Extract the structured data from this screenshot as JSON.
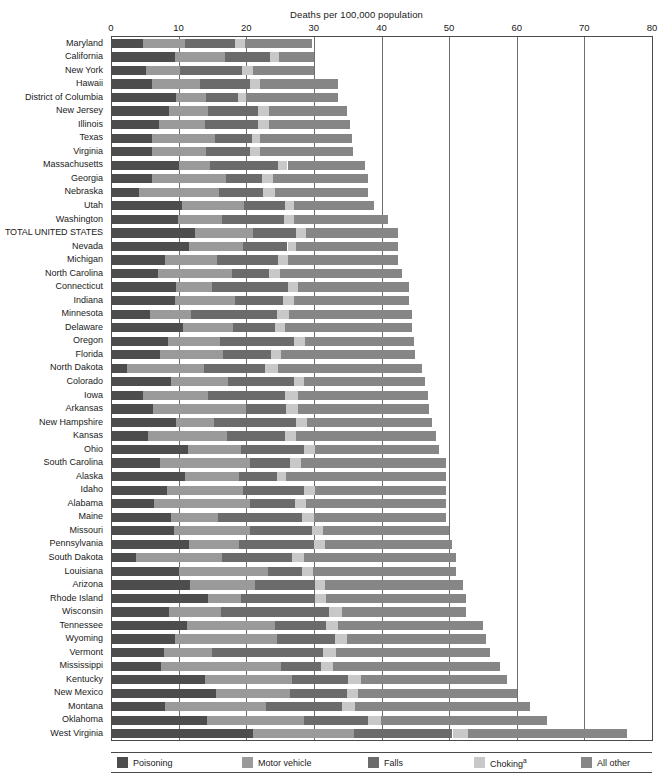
{
  "axis": {
    "title": "Deaths per 100,000 population",
    "ticks": [
      0,
      10,
      20,
      30,
      40,
      50,
      60,
      70,
      80
    ],
    "tick_labels": [
      "0",
      "10",
      "20",
      "30",
      "40",
      "50",
      "60",
      "70",
      "80"
    ],
    "min": 0,
    "max": 80
  },
  "legend": {
    "items": [
      {
        "label": "Poisoning",
        "color": "#4d4d4d",
        "superscript": ""
      },
      {
        "label": "Motor vehicle",
        "color": "#9a9a9a",
        "superscript": ""
      },
      {
        "label": "Falls",
        "color": "#6b6b6b",
        "superscript": ""
      },
      {
        "label": "Choking",
        "color": "#c8c8c8",
        "superscript": "a"
      },
      {
        "label": "All other",
        "color": "#868686",
        "superscript": ""
      }
    ]
  },
  "chart_data": {
    "type": "bar",
    "orientation": "horizontal",
    "stacked": true,
    "title": "Deaths per 100,000 population",
    "xlabel": "Deaths per 100,000 population",
    "ylabel": "",
    "xlim": [
      0,
      80
    ],
    "grid": true,
    "legend_position": "bottom",
    "series": [
      {
        "name": "Poisoning",
        "color": "#4d4d4d"
      },
      {
        "name": "Motor vehicle",
        "color": "#9a9a9a"
      },
      {
        "name": "Falls",
        "color": "#6b6b6b"
      },
      {
        "name": "Choking",
        "color": "#c8c8c8"
      },
      {
        "name": "All other",
        "color": "#868686"
      }
    ],
    "categories": [
      "Maryland",
      "California",
      "New York",
      "Hawaii",
      "District of Columbia",
      "New Jersey",
      "Illinois",
      "Texas",
      "Virginia",
      "Massachusetts",
      "Georgia",
      "Nebraska",
      "Utah",
      "Washington",
      "TOTAL UNITED STATES",
      "Nevada",
      "Michigan",
      "North Carolina",
      "Connecticut",
      "Indiana",
      "Minnesota",
      "Delaware",
      "Oregon",
      "Florida",
      "North Dakota",
      "Colorado",
      "Iowa",
      "Arkansas",
      "New Hampshire",
      "Kansas",
      "Ohio",
      "South Carolina",
      "Alaska",
      "Idaho",
      "Alabama",
      "Maine",
      "Missouri",
      "Pennsylvania",
      "South Dakota",
      "Louisiana",
      "Arizona",
      "Rhode Island",
      "Wisconsin",
      "Tennessee",
      "Wyoming",
      "Vermont",
      "Mississippi",
      "Kentucky",
      "New Mexico",
      "Montana",
      "Oklahoma",
      "West Virginia"
    ],
    "rows": [
      {
        "state": "Maryland",
        "values": [
          4.8,
          6.2,
          7.3,
          1.5,
          9.9
        ],
        "total": 29.7
      },
      {
        "state": "California",
        "values": [
          9.5,
          7.4,
          6.6,
          1.3,
          5.2
        ],
        "total": 30.0
      },
      {
        "state": "New York",
        "values": [
          5.2,
          5.0,
          9.1,
          1.7,
          9.0
        ],
        "total": 30.0
      },
      {
        "state": "Hawaii",
        "values": [
          6.1,
          7.0,
          7.4,
          1.6,
          11.4
        ],
        "total": 33.5
      },
      {
        "state": "District of Columbia",
        "values": [
          9.6,
          4.4,
          4.8,
          1.2,
          13.5
        ],
        "total": 33.5
      },
      {
        "state": "New Jersey",
        "values": [
          8.6,
          5.8,
          7.4,
          1.5,
          11.6
        ],
        "total": 34.9
      },
      {
        "state": "Illinois",
        "values": [
          7.1,
          6.8,
          7.9,
          1.5,
          12.1
        ],
        "total": 35.4
      },
      {
        "state": "Texas",
        "values": [
          6.0,
          9.4,
          5.4,
          1.3,
          13.6
        ],
        "total": 35.7
      },
      {
        "state": "Virginia",
        "values": [
          6.1,
          8.0,
          6.5,
          1.4,
          13.8
        ],
        "total": 35.8
      },
      {
        "state": "Massachusetts",
        "values": [
          10.1,
          4.6,
          10.0,
          1.4,
          11.5
        ],
        "total": 37.6
      },
      {
        "state": "Georgia",
        "values": [
          6.0,
          11.0,
          5.4,
          1.5,
          14.1
        ],
        "total": 38.0
      },
      {
        "state": "Nebraska",
        "values": [
          4.2,
          11.7,
          6.6,
          1.8,
          13.7
        ],
        "total": 38.0
      },
      {
        "state": "Utah",
        "values": [
          10.5,
          9.1,
          6.1,
          1.4,
          11.8
        ],
        "total": 38.9
      },
      {
        "state": "Washington",
        "values": [
          9.9,
          6.5,
          9.2,
          1.4,
          14.0
        ],
        "total": 41.0
      },
      {
        "state": "TOTAL UNITED STATES",
        "values": [
          12.4,
          8.6,
          6.4,
          1.4,
          13.6
        ],
        "total": 42.4
      },
      {
        "state": "Nevada",
        "values": [
          11.5,
          8.0,
          6.6,
          1.3,
          15.0
        ],
        "total": 42.4
      },
      {
        "state": "Michigan",
        "values": [
          8.0,
          7.7,
          9.0,
          1.5,
          16.3
        ],
        "total": 42.5
      },
      {
        "state": "North Carolina",
        "values": [
          6.9,
          11.0,
          5.5,
          1.6,
          18.0
        ],
        "total": 43.0
      },
      {
        "state": "Connecticut",
        "values": [
          9.6,
          5.4,
          11.2,
          1.5,
          16.3
        ],
        "total": 44.0
      },
      {
        "state": "Indiana",
        "values": [
          9.5,
          8.9,
          7.1,
          1.5,
          17.0
        ],
        "total": 44.0
      },
      {
        "state": "Minnesota",
        "values": [
          5.8,
          6.1,
          12.6,
          1.8,
          18.2
        ],
        "total": 44.5
      },
      {
        "state": "Delaware",
        "values": [
          10.6,
          7.4,
          6.3,
          1.5,
          18.7
        ],
        "total": 44.5
      },
      {
        "state": "Oregon",
        "values": [
          8.5,
          7.6,
          11.0,
          1.6,
          16.1
        ],
        "total": 44.8
      },
      {
        "state": "Florida",
        "values": [
          7.2,
          9.3,
          7.1,
          1.5,
          19.9
        ],
        "total": 45.0
      },
      {
        "state": "North Dakota",
        "values": [
          2.3,
          11.4,
          9.0,
          2.0,
          21.3
        ],
        "total": 46.0
      },
      {
        "state": "Colorado",
        "values": [
          8.9,
          8.4,
          9.8,
          1.5,
          17.9
        ],
        "total": 46.5
      },
      {
        "state": "Iowa",
        "values": [
          4.8,
          9.6,
          11.3,
          1.9,
          19.3
        ],
        "total": 46.9
      },
      {
        "state": "Arkansas",
        "values": [
          6.2,
          13.7,
          6.0,
          1.7,
          19.4
        ],
        "total": 47.0
      },
      {
        "state": "New Hampshire",
        "values": [
          9.6,
          5.7,
          12.0,
          1.7,
          18.5
        ],
        "total": 47.5
      },
      {
        "state": "Kansas",
        "values": [
          5.4,
          11.7,
          8.6,
          1.7,
          20.6
        ],
        "total": 48.0
      },
      {
        "state": "Ohio",
        "values": [
          11.4,
          7.8,
          9.3,
          1.6,
          18.4
        ],
        "total": 48.5
      },
      {
        "state": "South Carolina",
        "values": [
          7.3,
          13.3,
          5.9,
          1.6,
          21.4
        ],
        "total": 49.5
      },
      {
        "state": "Alaska",
        "values": [
          11.0,
          7.9,
          5.6,
          1.4,
          23.6
        ],
        "total": 49.5
      },
      {
        "state": "Idaho",
        "values": [
          8.3,
          11.2,
          9.0,
          1.7,
          19.3
        ],
        "total": 49.5
      },
      {
        "state": "Alabama",
        "values": [
          6.4,
          14.2,
          6.6,
          1.7,
          20.6
        ],
        "total": 49.5
      },
      {
        "state": "Maine",
        "values": [
          8.8,
          7.0,
          12.5,
          1.7,
          19.5
        ],
        "total": 49.5
      },
      {
        "state": "Missouri",
        "values": [
          9.3,
          11.3,
          9.1,
          1.7,
          18.6
        ],
        "total": 50.0
      },
      {
        "state": "Pennsylvania",
        "values": [
          11.6,
          7.4,
          11.0,
          1.7,
          18.8
        ],
        "total": 50.5
      },
      {
        "state": "South Dakota",
        "values": [
          3.7,
          12.7,
          10.3,
          1.9,
          22.4
        ],
        "total": 51.0
      },
      {
        "state": "Louisiana",
        "values": [
          10.0,
          13.2,
          5.1,
          1.5,
          21.2
        ],
        "total": 51.0
      },
      {
        "state": "Arizona",
        "values": [
          11.7,
          9.6,
          8.8,
          1.5,
          20.4
        ],
        "total": 52.0
      },
      {
        "state": "Rhode Island",
        "values": [
          14.3,
          4.9,
          11.0,
          1.6,
          20.7
        ],
        "total": 52.5
      },
      {
        "state": "Wisconsin",
        "values": [
          8.6,
          7.7,
          16.0,
          1.9,
          18.3
        ],
        "total": 52.5
      },
      {
        "state": "Tennessee",
        "values": [
          11.2,
          13.1,
          7.5,
          1.7,
          21.5
        ],
        "total": 55.0
      },
      {
        "state": "Wyoming",
        "values": [
          9.5,
          15.1,
          8.5,
          1.8,
          20.6
        ],
        "total": 55.5
      },
      {
        "state": "Vermont",
        "values": [
          7.9,
          7.0,
          16.5,
          1.9,
          22.7
        ],
        "total": 56.0
      },
      {
        "state": "Mississippi",
        "values": [
          7.4,
          17.8,
          5.9,
          1.7,
          24.7
        ],
        "total": 57.5
      },
      {
        "state": "Kentucky",
        "values": [
          13.9,
          12.9,
          8.3,
          1.8,
          21.6
        ],
        "total": 58.5
      },
      {
        "state": "New Mexico",
        "values": [
          15.5,
          11.0,
          8.4,
          1.6,
          23.5
        ],
        "total": 60.0
      },
      {
        "state": "Montana",
        "values": [
          8.0,
          14.9,
          11.2,
          2.0,
          25.9
        ],
        "total": 62.0
      },
      {
        "state": "Oklahoma",
        "values": [
          14.2,
          14.3,
          9.5,
          1.9,
          24.6
        ],
        "total": 64.5
      },
      {
        "state": "West Virginia",
        "values": [
          21.0,
          15.0,
          14.5,
          2.3,
          23.5
        ],
        "total": 76.3
      }
    ]
  }
}
